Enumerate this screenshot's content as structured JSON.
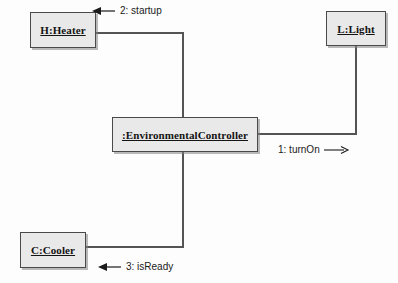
{
  "diagram": {
    "type": "uml-communication-diagram",
    "background_color": "#fdfdfd",
    "box_fill_color": "#e9e9e9",
    "box_border_color": "#4a4a4a",
    "line_color": "#545454",
    "objects": [
      {
        "id": "heater",
        "label": "H:Heater",
        "x": 30,
        "y": 12,
        "w": 66,
        "h": 36
      },
      {
        "id": "light",
        "label": "L:Light",
        "x": 326,
        "y": 11,
        "w": 60,
        "h": 35
      },
      {
        "id": "controller",
        "label": ":EnvironmentalController",
        "x": 112,
        "y": 117,
        "w": 146,
        "h": 35
      },
      {
        "id": "cooler",
        "label": "C:Cooler",
        "x": 20,
        "y": 232,
        "w": 66,
        "h": 36
      }
    ],
    "messages": [
      {
        "id": "msg-turnon",
        "sequence": "1",
        "name": "turnOn",
        "label": "1: turnOn",
        "direction": "right",
        "from": "controller",
        "to": "light",
        "x": 278,
        "y": 144
      },
      {
        "id": "msg-startup",
        "sequence": "2",
        "name": "startup",
        "label": "2: startup",
        "direction": "left",
        "from": "controller",
        "to": "heater",
        "x": 92,
        "y": 5
      },
      {
        "id": "msg-isready",
        "sequence": "3",
        "name": "isReady",
        "label": "3: isReady",
        "direction": "left",
        "from": "controller",
        "to": "cooler",
        "x": 98,
        "y": 261
      }
    ],
    "links": [
      {
        "id": "link-heater-controller",
        "from": "heater",
        "to": "controller",
        "path": "M 96 33 L 183 33 L 183 117"
      },
      {
        "id": "link-light-controller",
        "from": "light",
        "to": "controller",
        "path": "M 356 46 L 356 134 L 258 134"
      },
      {
        "id": "link-cooler-controller",
        "from": "cooler",
        "to": "controller",
        "path": "M 86 247 L 183 247 L 183 152"
      }
    ]
  }
}
